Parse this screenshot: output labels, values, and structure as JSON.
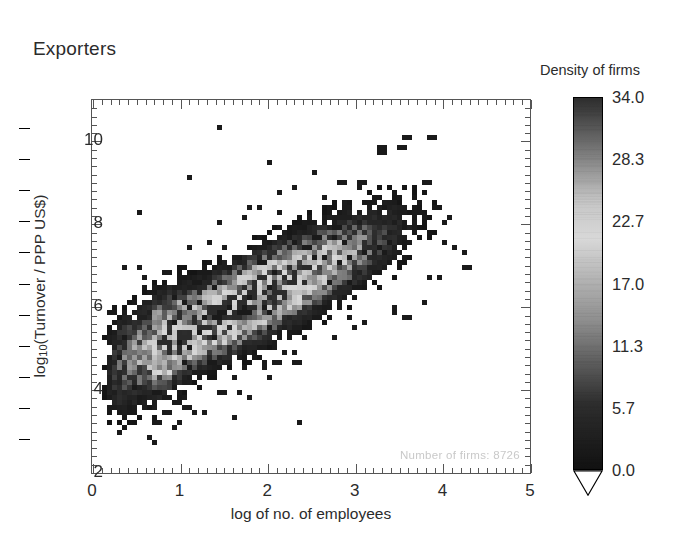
{
  "figure": {
    "title": "Exporters",
    "annotation": "Number of firms:  8726"
  },
  "colorbar": {
    "title": "Density of firms",
    "ticks": [
      "34.0",
      "28.3",
      "22.7",
      "17.0",
      "11.3",
      "5.7",
      "0.0"
    ],
    "min": 0.0,
    "max": 34.0,
    "low_color": "#111111",
    "mid_color": "#d8d8d8",
    "high_color": "#2b2b2b"
  },
  "chart_data": {
    "type": "heatmap",
    "title": "Exporters",
    "xlabel": "log of no. of employees",
    "ylabel": "log10(Turnover / PPP US$)",
    "xlim": [
      0,
      5
    ],
    "ylim": [
      2,
      11
    ],
    "xticks": [
      0,
      1,
      2,
      3,
      4,
      5
    ],
    "xticklabels": [
      "0",
      "1",
      "2",
      "3",
      "4",
      "5"
    ],
    "yticks": [
      2,
      4,
      6,
      8,
      10
    ],
    "yticklabels": [
      "2",
      "4",
      "6",
      "8",
      "10"
    ],
    "minor_tick_step_x": 0.1,
    "minor_tick_step_y": 0.2,
    "grid": false,
    "colorbar_label": "Density of firms",
    "zlim": [
      0,
      34
    ],
    "bin_size_x": 0.0568,
    "bin_size_y": 0.12,
    "number_of_firms": 8726,
    "legend_position": "right",
    "ridge_description": "Positive linear correlation: density ridge runs from (0.6, 4.9) to (3.1, 7.5) with slope ~1.05",
    "ridge_points": [
      {
        "x": 0.6,
        "y": 4.9,
        "z": 14
      },
      {
        "x": 0.8,
        "y": 5.1,
        "z": 22
      },
      {
        "x": 1.0,
        "y": 5.4,
        "z": 26
      },
      {
        "x": 1.2,
        "y": 5.7,
        "z": 29
      },
      {
        "x": 1.4,
        "y": 5.9,
        "z": 31
      },
      {
        "x": 1.6,
        "y": 6.1,
        "z": 32
      },
      {
        "x": 1.8,
        "y": 6.3,
        "z": 34
      },
      {
        "x": 2.0,
        "y": 6.6,
        "z": 32
      },
      {
        "x": 2.2,
        "y": 6.8,
        "z": 28
      },
      {
        "x": 2.4,
        "y": 7.0,
        "z": 22
      },
      {
        "x": 2.6,
        "y": 7.2,
        "z": 16
      },
      {
        "x": 2.8,
        "y": 7.4,
        "z": 10
      },
      {
        "x": 3.0,
        "y": 7.6,
        "z": 6
      },
      {
        "x": 3.4,
        "y": 7.9,
        "z": 3
      },
      {
        "x": 3.8,
        "y": 8.2,
        "z": 1
      }
    ],
    "vertical_stripes_x": [
      0.72,
      0.8,
      0.88,
      1.0
    ],
    "scatter_extent": {
      "x_min": 0.15,
      "x_max": 4.35,
      "y_min": 2.6,
      "y_max": 10.4
    }
  }
}
